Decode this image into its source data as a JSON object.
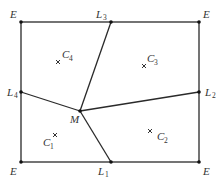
{
  "diagram": {
    "type": "rectangular partition diagram",
    "colors": {
      "line": "#2a2a2a",
      "vertex": "#111111",
      "text": "#333333",
      "background": "#ffffff"
    },
    "rectangle": {
      "x1": 21,
      "y1": 22,
      "x2": 199,
      "y2": 162
    },
    "corners": [
      {
        "id": "E_tl",
        "label": "E",
        "x": 21,
        "y": 22
      },
      {
        "id": "E_tr",
        "label": "E",
        "x": 199,
        "y": 22
      },
      {
        "id": "E_bl",
        "label": "E",
        "x": 21,
        "y": 162
      },
      {
        "id": "E_br",
        "label": "E",
        "x": 199,
        "y": 162
      }
    ],
    "edge_points": [
      {
        "id": "L1",
        "label": "L",
        "sub": "1",
        "x": 111,
        "y": 162
      },
      {
        "id": "L2",
        "label": "L",
        "sub": "2",
        "x": 199,
        "y": 92
      },
      {
        "id": "L3",
        "label": "L",
        "sub": "3",
        "x": 111,
        "y": 22
      },
      {
        "id": "L4",
        "label": "L",
        "sub": "4",
        "x": 21,
        "y": 92
      }
    ],
    "center_point": {
      "id": "M",
      "label": "M",
      "x": 80,
      "y": 111
    },
    "segments": [
      {
        "from": "M",
        "to": "L1"
      },
      {
        "from": "M",
        "to": "L2"
      },
      {
        "from": "M",
        "to": "L3"
      },
      {
        "from": "M",
        "to": "L4"
      }
    ],
    "regions": [
      {
        "id": "C1",
        "label": "C",
        "sub": "1",
        "x": 55,
        "y": 135
      },
      {
        "id": "C2",
        "label": "C",
        "sub": "2",
        "x": 150,
        "y": 131
      },
      {
        "id": "C3",
        "label": "C",
        "sub": "3",
        "x": 144,
        "y": 66
      },
      {
        "id": "C4",
        "label": "C",
        "sub": "4",
        "x": 58,
        "y": 62
      }
    ],
    "labels": {
      "E_tl": "E",
      "E_tr": "E",
      "E_bl": "E",
      "E_br": "E",
      "L": "L",
      "L1_sub": "1",
      "L2_sub": "2",
      "L3_sub": "3",
      "L4_sub": "4",
      "M": "M",
      "C": "C",
      "C1_sub": "1",
      "C2_sub": "2",
      "C3_sub": "3",
      "C4_sub": "4"
    }
  }
}
